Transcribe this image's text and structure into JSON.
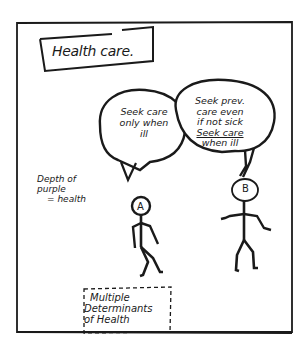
{
  "title": "Health care.",
  "panel": {
    "frame_color": "#1a1a1a",
    "background": "#ffffff"
  },
  "figures": [
    {
      "id": "A",
      "label": "A",
      "speech": [
        "Seek care",
        "only when",
        "ill"
      ]
    },
    {
      "id": "B",
      "label": "B",
      "speech": [
        "Seek prev.",
        "care even",
        "if not sick",
        "Seek care",
        "when ill"
      ]
    }
  ],
  "note": {
    "lines": [
      "Depth of",
      "purple",
      "= health"
    ]
  },
  "footer_box": {
    "lines": [
      "Multiple",
      "Determinants",
      "of Health"
    ]
  }
}
